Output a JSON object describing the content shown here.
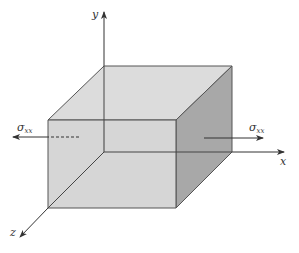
{
  "figure": {
    "colors": {
      "top_face": "#dcdcdc",
      "front_face": "#d2d2d2",
      "right_face": "#a8a8a8",
      "edge": "#555555",
      "axis": "#333333"
    },
    "axes": {
      "x_label": "x",
      "y_label": "y",
      "z_label": "z"
    },
    "stress_left": {
      "symbol": "σ",
      "subscript": "xx"
    },
    "stress_right": {
      "symbol": "σ",
      "subscript": "xx"
    }
  }
}
